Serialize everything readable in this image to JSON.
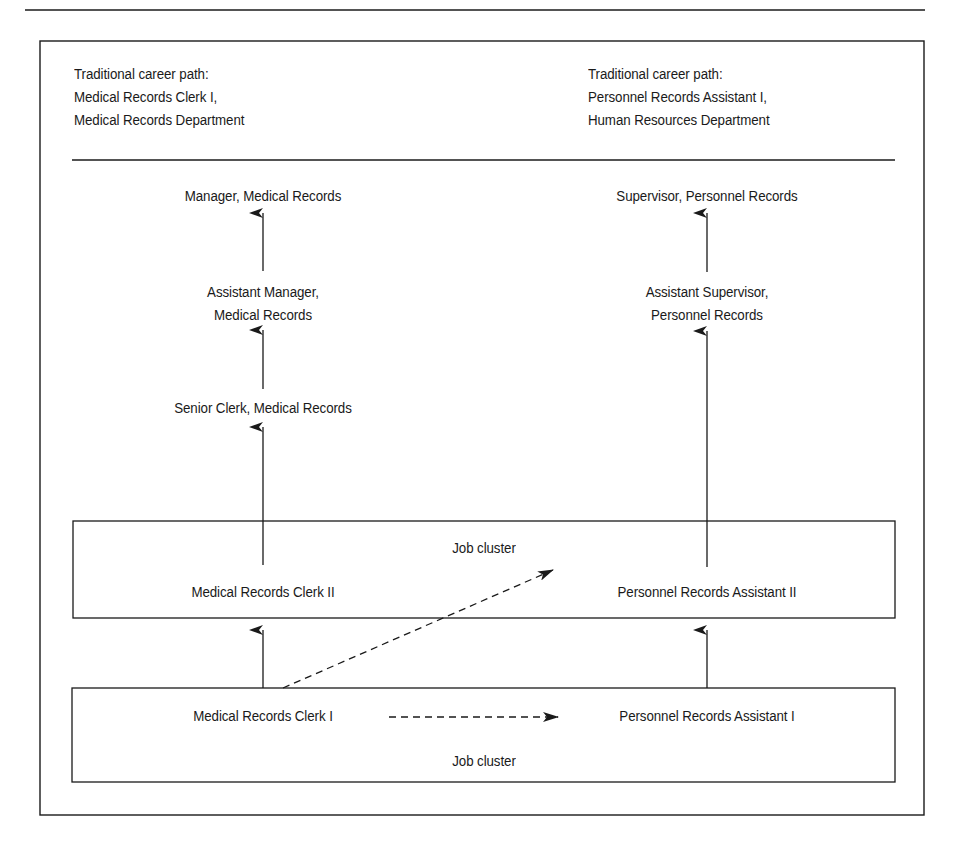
{
  "header": {
    "left": {
      "line1": "Traditional career path:",
      "line2": "Medical Records Clerk I,",
      "line3": "Medical Records Department"
    },
    "right": {
      "line1": "Traditional career path:",
      "line2": "Personnel Records Assistant I,",
      "line3": "Human Resources Department"
    }
  },
  "left_path": {
    "level4": "Manager, Medical Records",
    "level3_line1": "Assistant Manager,",
    "level3_line2": "Medical Records",
    "level2": "Senior Clerk, Medical Records"
  },
  "right_path": {
    "level4": "Supervisor, Personnel Records",
    "level3_line1": "Assistant Supervisor,",
    "level3_line2": "Personnel Records"
  },
  "upper_cluster": {
    "label": "Job cluster",
    "left_job": "Medical Records Clerk II",
    "right_job": "Personnel Records Assistant II"
  },
  "lower_cluster": {
    "label": "Job cluster",
    "left_job": "Medical Records Clerk I",
    "right_job": "Personnel Records Assistant I"
  },
  "colors": {
    "ink": "#1a1a1a",
    "background": "#ffffff"
  }
}
